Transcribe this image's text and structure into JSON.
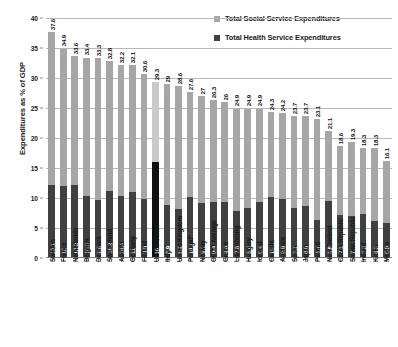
{
  "chart_data": {
    "type": "bar",
    "subtype": "stacked-bar",
    "title": "",
    "xlabel": "",
    "ylabel": "Expenditures as % of GDP",
    "ylim": [
      0,
      40
    ],
    "ytick_step": 5,
    "yticks": [
      "0",
      "5",
      "10",
      "15",
      "20",
      "25",
      "30",
      "35",
      "40"
    ],
    "grid": true,
    "legend_position": "top-right",
    "legend": [
      {
        "label": "Total Social Service Expenditures",
        "color": "#a6a6a6"
      },
      {
        "label": "Total Health Service Expenditures",
        "color": "#404040"
      }
    ],
    "note": "Value labels above each bar are the stack totals; labels inside the dark segment are health expenditures.",
    "categories": [
      "Sweden",
      "France",
      "Netherlands",
      "Belgium",
      "Denmark",
      "Switzerland",
      "Austria",
      "Germany",
      "Finland",
      "United States",
      "Italy",
      "United Kingdom",
      "Portugal*",
      "Norway",
      "OECD Average",
      "Greece",
      "Luxembourg",
      "Hungary",
      "Iceland",
      "Canada",
      "Australia",
      "Spain",
      "Japan",
      "Poland",
      "New Zealand",
      "Czech Republic",
      "Slovak Republic",
      "Ireland",
      "Korea",
      "Mexico"
    ],
    "series": [
      {
        "name": "Total Health Service Expenditures",
        "color": "#404040",
        "values": [
          12.1,
          12,
          12.2,
          10.3,
          9.6,
          11.2,
          10.4,
          11,
          9.8,
          16,
          8.9,
          8.2,
          10.2,
          9.1,
          9.4,
          9.4,
          7.8,
          8.4,
          9.4,
          10.1,
          9.9,
          8.3,
          8.6,
          6.4,
          9.5,
          7.1,
          7,
          7.3,
          6.2,
          5.8
        ]
      },
      {
        "name": "Total Social Service Expenditures",
        "color": "#a6a6a6",
        "values": [
          25.5,
          22.9,
          21.4,
          23.1,
          23.7,
          21.6,
          21.8,
          21.1,
          20.8,
          13.3,
          20.1,
          20.4,
          17.4,
          17.9,
          16.9,
          16.6,
          17.1,
          16.5,
          15.5,
          14.3,
          14.3,
          15.4,
          15.1,
          16.7,
          11.6,
          11.5,
          12.3,
          11.0,
          12.1,
          10.3
        ]
      }
    ],
    "totals": [
      37.6,
      34.9,
      33.6,
      33.4,
      33.3,
      32.8,
      32.2,
      32.1,
      30.6,
      29.3,
      29.0,
      28.6,
      27.6,
      27.0,
      26.3,
      26.0,
      24.9,
      24.9,
      24.9,
      24.3,
      24.2,
      23.7,
      23.7,
      23.1,
      21.1,
      18.6,
      19.3,
      18.3,
      18.3,
      16.1
    ],
    "highlight_category": "United States"
  }
}
